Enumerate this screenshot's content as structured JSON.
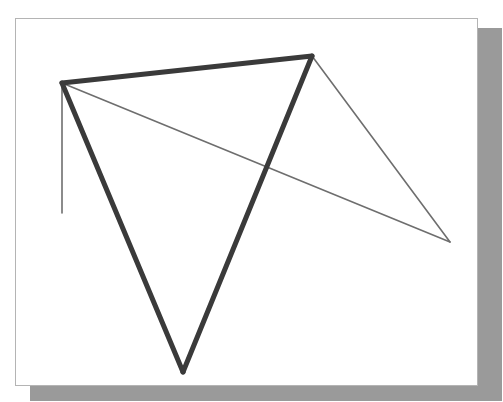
{
  "figure": {
    "background_color": "#ffffff",
    "paper_color": "#ffffff",
    "paper_border_color": "#b4b4b4",
    "shadow_color": "#9a9a9a",
    "thick_stroke_color": "#3a3a3a",
    "thin_stroke_color": "#6e6e6e",
    "thick_stroke_width": "5",
    "thin_stroke_width": "1.6",
    "paper": {
      "x": 15,
      "y": 18,
      "width": 463,
      "height": 368
    },
    "shadow": {
      "x": 30,
      "y": 28,
      "width": 472,
      "height": 373
    }
  },
  "chart_data": {
    "type": "scatter",
    "xlabel": "",
    "ylabel": "",
    "xlim": [
      0,
      503
    ],
    "ylim": [
      0,
      402
    ],
    "grid": false,
    "legend": "none",
    "points": [
      {
        "name": "A",
        "label": "left-apex",
        "x": 62,
        "y": 83
      },
      {
        "name": "B",
        "label": "top-right-apex",
        "x": 312,
        "y": 56
      },
      {
        "name": "C",
        "label": "bottom-apex",
        "x": 183,
        "y": 372
      },
      {
        "name": "D",
        "label": "right-apex",
        "x": 450,
        "y": 242
      },
      {
        "name": "E",
        "label": "vertical-stub-end",
        "x": 62,
        "y": 213
      }
    ],
    "segments": [
      {
        "name": "thick-edge-top",
        "from": "A",
        "to": "B",
        "x1": 62,
        "y1": 83,
        "x2": 312,
        "y2": 56,
        "weight": "thick",
        "color": "#3a3a3a"
      },
      {
        "name": "thick-edge-left",
        "from": "A",
        "to": "C",
        "x1": 62,
        "y1": 83,
        "x2": 183,
        "y2": 372,
        "weight": "thick",
        "color": "#3a3a3a"
      },
      {
        "name": "thick-edge-right",
        "from": "B",
        "to": "C",
        "x1": 312,
        "y1": 56,
        "x2": 183,
        "y2": 372,
        "weight": "thick",
        "color": "#3a3a3a"
      },
      {
        "name": "thin-diagonal-a-to-d",
        "from": "A",
        "to": "D",
        "x1": 62,
        "y1": 83,
        "x2": 450,
        "y2": 242,
        "weight": "thin",
        "color": "#6e6e6e"
      },
      {
        "name": "thin-edge-b-to-d",
        "from": "B",
        "to": "D",
        "x1": 312,
        "y1": 56,
        "x2": 450,
        "y2": 242,
        "weight": "thin",
        "color": "#6e6e6e"
      },
      {
        "name": "thin-vertical-stub",
        "from": "A",
        "to": "E",
        "x1": 62,
        "y1": 83,
        "x2": 62,
        "y2": 213,
        "weight": "thin",
        "color": "#6e6e6e"
      }
    ],
    "shapes": [
      {
        "name": "thick-triangle",
        "vertices": [
          "A",
          "B",
          "C"
        ],
        "weight": "thick"
      },
      {
        "name": "thin-triangle",
        "vertices": [
          "A",
          "B",
          "D"
        ],
        "weight": "thin"
      }
    ]
  }
}
